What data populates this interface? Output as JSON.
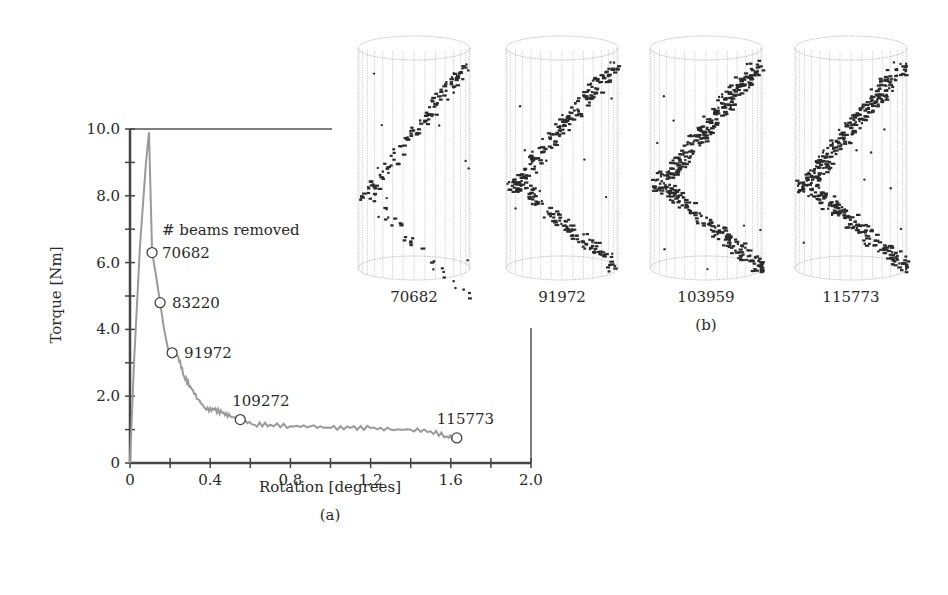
{
  "chart_data": [
    {
      "panel": "(a)",
      "type": "line",
      "xlabel": "Rotation [degrees]",
      "ylabel": "Torque [Nm]",
      "xlim": [
        0,
        2.0
      ],
      "ylim": [
        0,
        10.0
      ],
      "xticks": [
        "0",
        "0.4",
        "0.8",
        "1.2",
        "1.6",
        "2.0"
      ],
      "yticks": [
        "0",
        "2.0",
        "4.0",
        "6.0",
        "8.0",
        "10.0"
      ],
      "grid": false,
      "series": [
        {
          "name": "Torque",
          "color": "#9a9a9a",
          "x": [
            0.0,
            0.02,
            0.05,
            0.08,
            0.095,
            0.11,
            0.13,
            0.15,
            0.17,
            0.19,
            0.21,
            0.24,
            0.27,
            0.3,
            0.34,
            0.38,
            0.42,
            0.46,
            0.5,
            0.55,
            0.62,
            0.7,
            0.8,
            0.9,
            1.0,
            1.1,
            1.2,
            1.3,
            1.4,
            1.5,
            1.58,
            1.63
          ],
          "y": [
            0.0,
            3.0,
            6.5,
            9.0,
            9.9,
            6.3,
            5.6,
            4.8,
            4.0,
            3.4,
            3.3,
            3.2,
            2.6,
            2.3,
            1.9,
            1.6,
            1.6,
            1.5,
            1.4,
            1.3,
            1.15,
            1.15,
            1.1,
            1.1,
            1.05,
            1.05,
            1.05,
            1.0,
            1.0,
            0.95,
            0.8,
            0.75
          ]
        }
      ],
      "markers": [
        {
          "label": "70682",
          "x": 0.11,
          "y": 6.3
        },
        {
          "label": "83220",
          "x": 0.15,
          "y": 4.8
        },
        {
          "label": "91972",
          "x": 0.21,
          "y": 3.3
        },
        {
          "label": "109272",
          "x": 0.55,
          "y": 1.3
        },
        {
          "label": "115773",
          "x": 1.63,
          "y": 0.75
        }
      ],
      "annotations": [
        "# beams removed"
      ]
    },
    {
      "panel": "(b)",
      "type": "scatter",
      "title": "",
      "subplots": [
        {
          "label": "70682"
        },
        {
          "label": "91972"
        },
        {
          "label": "103959"
        },
        {
          "label": "115773"
        }
      ]
    }
  ],
  "figure": {
    "caption_a": "(a)",
    "caption_b": "(b)",
    "annotation_title": "# beams removed"
  }
}
